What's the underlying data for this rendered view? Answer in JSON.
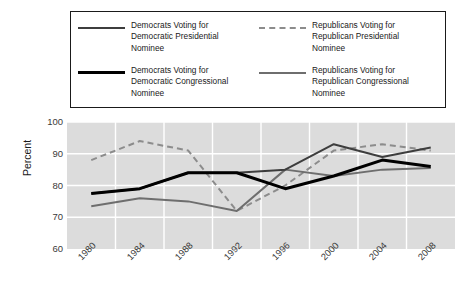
{
  "chart_data": {
    "type": "line",
    "title": "",
    "xlabel": "",
    "ylabel": "Percent",
    "categories": [
      "1980",
      "1984",
      "1988",
      "1992",
      "1996",
      "2000",
      "2004",
      "2008"
    ],
    "ylim": [
      60,
      100
    ],
    "yticks": [
      "60",
      "70",
      "80",
      "90",
      "100"
    ],
    "grid": true,
    "legend_position": "top",
    "series": [
      {
        "name": "Democrats Voting for Democratic Presidential Nominee",
        "label_lines": "Democrats Voting for\nDemocratic Presidential\nNominee",
        "style": "solid",
        "color": "#3d3d3d",
        "width": 2,
        "values": [
          77.5,
          79,
          84,
          84,
          85,
          93,
          89,
          92
        ]
      },
      {
        "name": "Republicans Voting for Republican Presidential Nominee",
        "label_lines": "Republicans Voting for\nRepublican Presidential\nNominee",
        "style": "dashed",
        "color": "#8c8c8c",
        "width": 2,
        "values": [
          88,
          94,
          91,
          72,
          80,
          91,
          93,
          91
        ]
      },
      {
        "name": "Democrats Voting for Democratic Congressional Nominee",
        "label_lines": "Democrats Voting for\nDemocratic Congressional\nNominee",
        "style": "solid",
        "color": "#000000",
        "width": 3,
        "values": [
          77.5,
          79,
          84,
          84,
          79,
          83,
          88,
          86
        ]
      },
      {
        "name": "Republicans Voting for Republican Congressional Nominee",
        "label_lines": "Republicans Voting for\nRepublican Congressional\nNominee",
        "style": "solid",
        "color": "#6e6e6e",
        "width": 2,
        "values": [
          73.5,
          76,
          75,
          72,
          85,
          83,
          85,
          85.5
        ]
      }
    ],
    "colors": {
      "plot_background": "#dcdcdc",
      "gridline": "#ffffff",
      "legend_border": "#1a1a1a",
      "text": "#1a1a1a"
    }
  }
}
